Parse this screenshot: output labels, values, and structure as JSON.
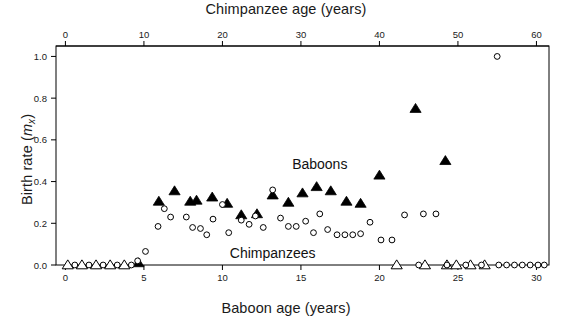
{
  "figure": {
    "top_axis_title": "Chimpanzee age (years)",
    "bottom_axis_title": "Baboon age (years)",
    "y_axis_title_prefix": "Birth rate (",
    "y_axis_title_symbol": "m",
    "y_axis_title_sub": "x",
    "y_axis_title_suffix": ")",
    "baboon_label": "Baboons",
    "chimpanzee_label": "Chimpanzees"
  },
  "chart_data": {
    "type": "scatter",
    "title": "",
    "xlabel": "Baboon age (years)",
    "xlabel_top": "Chimpanzee age (years)",
    "ylabel": "Birth rate (mx)",
    "ylim": [
      0.0,
      1.05
    ],
    "xlim_baboon": [
      -0.6,
      30.8
    ],
    "xlim_chimp": [
      -1.2,
      61.6
    ],
    "grid": false,
    "legend": "in-plot text labels",
    "y_ticks": [
      "0.0",
      "0.2",
      "0.4",
      "0.6",
      "0.8",
      "1.0"
    ],
    "y_tick_values": [
      0.0,
      0.2,
      0.4,
      0.6,
      0.8,
      1.0
    ],
    "x_ticks_bottom": [
      "0",
      "5",
      "10",
      "15",
      "20",
      "25",
      "30"
    ],
    "x_tick_values_bottom": [
      0,
      5,
      10,
      15,
      20,
      25,
      30
    ],
    "x_ticks_top": [
      "0",
      "10",
      "20",
      "30",
      "40",
      "50",
      "60"
    ],
    "x_tick_values_top": [
      0,
      10,
      20,
      30,
      40,
      50,
      60
    ],
    "series": [
      {
        "name": "Baboons",
        "marker": "triangle-filled-and-open",
        "color": "#000000",
        "x_axis": "bottom",
        "note": "open triangles at zero birth rate, filled triangles for nonzero",
        "points": [
          {
            "x": 0.15,
            "y": 0.0,
            "filled": false
          },
          {
            "x": 1.05,
            "y": 0.0,
            "filled": false
          },
          {
            "x": 1.95,
            "y": 0.0,
            "filled": false
          },
          {
            "x": 2.85,
            "y": 0.0,
            "filled": false
          },
          {
            "x": 3.75,
            "y": 0.0,
            "filled": false
          },
          {
            "x": 4.65,
            "y": 0.01,
            "filled": true
          },
          {
            "x": 5.95,
            "y": 0.305,
            "filled": true
          },
          {
            "x": 6.95,
            "y": 0.355,
            "filled": true
          },
          {
            "x": 7.95,
            "y": 0.305,
            "filled": true
          },
          {
            "x": 8.35,
            "y": 0.31,
            "filled": true
          },
          {
            "x": 9.35,
            "y": 0.325,
            "filled": true
          },
          {
            "x": 10.3,
            "y": 0.295,
            "filled": true
          },
          {
            "x": 11.2,
            "y": 0.24,
            "filled": true
          },
          {
            "x": 12.2,
            "y": 0.245,
            "filled": true
          },
          {
            "x": 13.2,
            "y": 0.335,
            "filled": true
          },
          {
            "x": 14.2,
            "y": 0.3,
            "filled": true
          },
          {
            "x": 15.1,
            "y": 0.345,
            "filled": true
          },
          {
            "x": 16.0,
            "y": 0.375,
            "filled": true
          },
          {
            "x": 16.9,
            "y": 0.355,
            "filled": true
          },
          {
            "x": 17.9,
            "y": 0.305,
            "filled": true
          },
          {
            "x": 18.8,
            "y": 0.295,
            "filled": true
          },
          {
            "x": 20.0,
            "y": 0.43,
            "filled": true
          },
          {
            "x": 21.1,
            "y": 0.0,
            "filled": false
          },
          {
            "x": 22.9,
            "y": 0.0,
            "filled": false
          },
          {
            "x": 24.3,
            "y": 0.0,
            "filled": false
          },
          {
            "x": 24.9,
            "y": 0.0,
            "filled": false
          },
          {
            "x": 25.8,
            "y": 0.0,
            "filled": false
          },
          {
            "x": 26.7,
            "y": 0.0,
            "filled": false
          },
          {
            "x": 22.3,
            "y": 0.75,
            "filled": true
          },
          {
            "x": 24.2,
            "y": 0.5,
            "filled": true
          }
        ]
      },
      {
        "name": "Chimpanzees",
        "marker": "circle-open",
        "color": "#000000",
        "x_axis": "top",
        "note": "plotted against chimpanzee age on the top axis",
        "points": [
          {
            "x": 1.2,
            "y": 0.0
          },
          {
            "x": 3.0,
            "y": 0.0
          },
          {
            "x": 4.8,
            "y": 0.0
          },
          {
            "x": 6.6,
            "y": 0.0
          },
          {
            "x": 8.4,
            "y": 0.0
          },
          {
            "x": 9.2,
            "y": 0.02
          },
          {
            "x": 10.2,
            "y": 0.065
          },
          {
            "x": 11.8,
            "y": 0.185
          },
          {
            "x": 12.6,
            "y": 0.27
          },
          {
            "x": 13.4,
            "y": 0.23
          },
          {
            "x": 15.4,
            "y": 0.23
          },
          {
            "x": 16.2,
            "y": 0.18
          },
          {
            "x": 17.2,
            "y": 0.175
          },
          {
            "x": 18.0,
            "y": 0.145
          },
          {
            "x": 18.8,
            "y": 0.22
          },
          {
            "x": 20.0,
            "y": 0.29
          },
          {
            "x": 20.8,
            "y": 0.155
          },
          {
            "x": 22.4,
            "y": 0.215
          },
          {
            "x": 23.4,
            "y": 0.195
          },
          {
            "x": 24.2,
            "y": 0.235
          },
          {
            "x": 25.2,
            "y": 0.18
          },
          {
            "x": 26.4,
            "y": 0.36
          },
          {
            "x": 27.4,
            "y": 0.225
          },
          {
            "x": 28.4,
            "y": 0.185
          },
          {
            "x": 29.4,
            "y": 0.185
          },
          {
            "x": 30.6,
            "y": 0.21
          },
          {
            "x": 31.6,
            "y": 0.155
          },
          {
            "x": 32.4,
            "y": 0.245
          },
          {
            "x": 33.4,
            "y": 0.17
          },
          {
            "x": 34.6,
            "y": 0.145
          },
          {
            "x": 35.6,
            "y": 0.145
          },
          {
            "x": 36.6,
            "y": 0.145
          },
          {
            "x": 37.6,
            "y": 0.15
          },
          {
            "x": 38.8,
            "y": 0.205
          },
          {
            "x": 40.2,
            "y": 0.12
          },
          {
            "x": 41.6,
            "y": 0.12
          },
          {
            "x": 43.2,
            "y": 0.24
          },
          {
            "x": 45.6,
            "y": 0.245
          },
          {
            "x": 47.2,
            "y": 0.245
          },
          {
            "x": 45.0,
            "y": 0.0
          },
          {
            "x": 48.6,
            "y": 0.0
          },
          {
            "x": 51.0,
            "y": 0.0
          },
          {
            "x": 53.0,
            "y": 0.0
          },
          {
            "x": 55.2,
            "y": 0.0
          },
          {
            "x": 56.2,
            "y": 0.0
          },
          {
            "x": 57.2,
            "y": 0.0
          },
          {
            "x": 58.2,
            "y": 0.0
          },
          {
            "x": 59.2,
            "y": 0.0
          },
          {
            "x": 60.2,
            "y": 0.0
          },
          {
            "x": 61.0,
            "y": 0.0
          },
          {
            "x": 55.0,
            "y": 1.0
          }
        ]
      }
    ]
  }
}
